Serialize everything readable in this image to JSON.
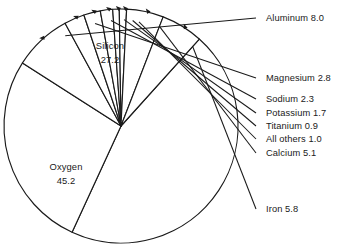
{
  "chart_data": {
    "type": "pie",
    "title": "",
    "subtitle": "",
    "xlabel": "",
    "ylabel": "",
    "units": "percent",
    "grid": false,
    "legend_position": "none",
    "label_style": "inside-labels-for-large-slices, leader-line-callouts-for-small-slices",
    "categories": [
      "Oxygen",
      "Silicon",
      "Aluminum",
      "Iron",
      "Calcium",
      "Magnesium",
      "Sodium",
      "Potassium",
      "All others",
      "Titanium"
    ],
    "values": [
      45.2,
      27.2,
      8.0,
      5.8,
      5.1,
      2.8,
      2.3,
      1.7,
      1.0,
      0.9
    ],
    "total": 100.0,
    "slices": [
      {
        "name": "Oxygen",
        "value": 45.2,
        "value_text": "45.2",
        "label_text": "Oxygen",
        "label_placement": "inside",
        "label_x": 66,
        "label_y_line1": 170,
        "label_y_line2": 184
      },
      {
        "name": "Silicon",
        "value": 27.2,
        "value_text": "27.2",
        "label_text": "Silicon",
        "label_placement": "inside",
        "label_x": 110,
        "label_y_line1": 49,
        "label_y_line2": 63
      },
      {
        "name": "Aluminum",
        "value": 8.0,
        "value_text": "8.0",
        "label_text": "Aluminum 8.0",
        "label_placement": "callout",
        "label_x": 266,
        "label_y": 21
      },
      {
        "name": "Magnesium",
        "value": 2.8,
        "value_text": "2.8",
        "label_text": "Magnesium 2.8",
        "label_placement": "callout",
        "label_x": 266,
        "label_y": 81
      },
      {
        "name": "Sodium",
        "value": 2.3,
        "value_text": "2.3",
        "label_text": "Sodium 2.3",
        "label_placement": "callout",
        "label_x": 266,
        "label_y": 102
      },
      {
        "name": "Potassium",
        "value": 1.7,
        "value_text": "1.7",
        "label_text": "Potassium 1.7",
        "label_placement": "callout",
        "label_x": 266,
        "label_y": 116
      },
      {
        "name": "Titanium",
        "value": 0.9,
        "value_text": "0.9",
        "label_text": "Titanium 0.9",
        "label_placement": "callout",
        "label_x": 266,
        "label_y": 129
      },
      {
        "name": "All others",
        "value": 1.0,
        "value_text": "1.0",
        "label_text": "All others 1.0",
        "label_placement": "callout",
        "label_x": 266,
        "label_y": 142
      },
      {
        "name": "Calcium",
        "value": 5.1,
        "value_text": "5.1",
        "label_text": "Calcium 5.1",
        "label_placement": "callout",
        "label_x": 266,
        "label_y": 156
      },
      {
        "name": "Iron",
        "value": 5.8,
        "value_text": "5.8",
        "label_text": "Iron 5.8",
        "label_placement": "callout",
        "label_x": 266,
        "label_y": 212
      }
    ],
    "colors": {
      "slice_fill": "#ffffff",
      "outline": "#1a1a1a",
      "text": "#1a1a1a",
      "background": "#ffffff"
    },
    "geometry": {
      "center_x": 121,
      "center_y": 126,
      "radius": 117,
      "start_angle_deg": -48,
      "direction": "clockwise"
    }
  }
}
